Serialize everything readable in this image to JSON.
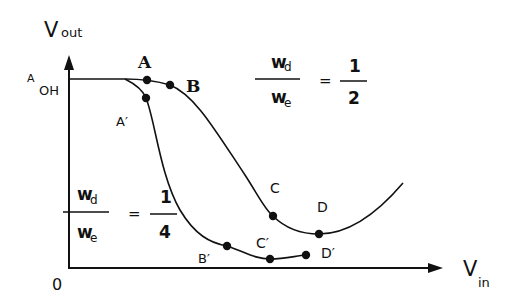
{
  "axes": {
    "y_label": "V",
    "y_label_sub": "out",
    "x_label": "V",
    "x_label_sub": "in",
    "origin": "0",
    "voh_label": "V",
    "voh_label_pre": "A",
    "voh_label_sub": "OH"
  },
  "ratio_upper": {
    "num": "w",
    "num_sub": "d",
    "den": "w",
    "den_sub": "e",
    "equals": "=",
    "value_num": "1",
    "value_den": "2"
  },
  "ratio_lower": {
    "num": "w",
    "num_sub": "d",
    "den": "w",
    "den_sub": "e",
    "equals": "=",
    "value_num": "1",
    "value_den": "4"
  },
  "points": {
    "A": "A",
    "B": "B",
    "C": "C",
    "D": "D",
    "A_prime": "A′",
    "B_prime": "B′",
    "C_prime": "C′",
    "D_prime": "D′"
  },
  "colors": {
    "ink": "#111111",
    "background": "#ffffff"
  }
}
